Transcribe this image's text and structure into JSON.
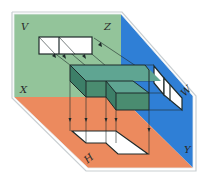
{
  "diagram": {
    "planes": {
      "V": {
        "label": "V",
        "color": "#93c49a"
      },
      "W": {
        "label": "W",
        "color": "#2f7fd6"
      },
      "H": {
        "label": "H",
        "color": "#ec8a5e"
      }
    },
    "axes": {
      "X": {
        "label": "X"
      },
      "Y": {
        "label": "Y"
      },
      "Z": {
        "label": "Z"
      }
    },
    "object": {
      "name": "L-shaped block",
      "top_color": "#5fa592",
      "side_color": "#3d7f68",
      "front_color": "#4a8c70"
    },
    "projections": {
      "fill": "#ffffff",
      "views": [
        "front view on V",
        "side view on W",
        "top view on H"
      ]
    }
  }
}
